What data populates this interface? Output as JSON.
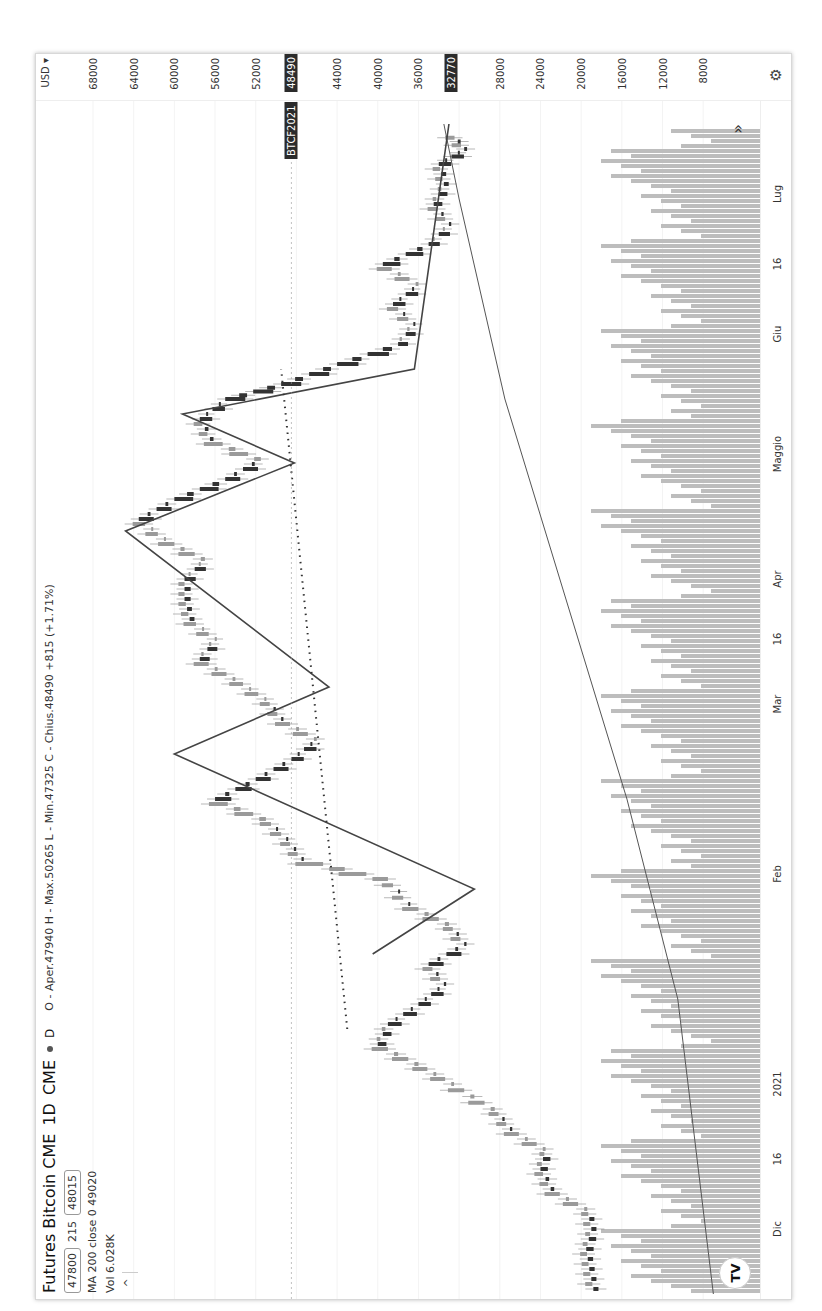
{
  "header": {
    "title": "Futures Bitcoin CME",
    "interval": "1D",
    "exchange": "CME",
    "interval_short": "D",
    "ohlc": "O - Aper.47940 H - Max.50265 L - Min.47325 C - Chius.48490 +815 (+1.71%)"
  },
  "quote": {
    "bid": "47800",
    "spread": "215",
    "ask": "48015"
  },
  "indicators": {
    "ma": "MA 200 close 0  49020",
    "vol": "Vol  6.028K",
    "collapse_icon": "^"
  },
  "price_axis": {
    "currency": "USD ▾",
    "ticks": [
      "68000",
      "64000",
      "60000",
      "56000",
      "52000",
      "44000",
      "40000",
      "36000",
      "28000",
      "24000",
      "20000",
      "16000",
      "12000",
      "8000"
    ],
    "current_symbol": "BTCF2021",
    "current_price": "48490",
    "second_price": "32770"
  },
  "time_axis": {
    "labels": [
      {
        "t": "Dic",
        "u": 70
      },
      {
        "t": "16",
        "u": 140
      },
      {
        "t": "2021",
        "u": 215
      },
      {
        "t": "Feb",
        "u": 425
      },
      {
        "t": "Mar",
        "u": 595
      },
      {
        "t": "16",
        "u": 660
      },
      {
        "t": "Apr",
        "u": 720
      },
      {
        "t": "Maggio",
        "u": 845
      },
      {
        "t": "Giu",
        "u": 965
      },
      {
        "t": "16",
        "u": 1035
      },
      {
        "t": "Lug",
        "u": 1105
      }
    ]
  },
  "colors": {
    "candle_up": "#9a9a9a",
    "candle_down": "#333333",
    "volume": "#bdbdbd",
    "ma": "#555555",
    "zigzag": "#444444",
    "grid": "#e6e6e6"
  },
  "chart_data": {
    "type": "candlestick",
    "title": "Futures Bitcoin CME 1D CME",
    "xlabel": "",
    "ylabel": "USD",
    "ylim": [
      6000,
      70000
    ],
    "x_ticks": [
      "Dic",
      "16",
      "2021",
      "Feb",
      "Mar",
      "16",
      "Apr",
      "Maggio",
      "Giu",
      "16",
      "Lug"
    ],
    "y_ticks": [
      68000,
      64000,
      60000,
      56000,
      52000,
      48000,
      44000,
      40000,
      36000,
      32000,
      28000,
      24000,
      20000,
      16000,
      12000,
      8000
    ],
    "last_close": 48490,
    "marked_price": 32770,
    "closes": [
      {
        "u": 10,
        "p": 18800
      },
      {
        "u": 30,
        "p": 19200
      },
      {
        "u": 50,
        "p": 19500
      },
      {
        "u": 70,
        "p": 19000
      },
      {
        "u": 90,
        "p": 19400
      },
      {
        "u": 110,
        "p": 23000
      },
      {
        "u": 130,
        "p": 24000
      },
      {
        "u": 150,
        "p": 23500
      },
      {
        "u": 170,
        "p": 27000
      },
      {
        "u": 190,
        "p": 28500
      },
      {
        "u": 215,
        "p": 32500
      },
      {
        "u": 235,
        "p": 36000
      },
      {
        "u": 255,
        "p": 40000
      },
      {
        "u": 275,
        "p": 39000
      },
      {
        "u": 295,
        "p": 36000
      },
      {
        "u": 315,
        "p": 33500
      },
      {
        "u": 335,
        "p": 35000
      },
      {
        "u": 355,
        "p": 31500
      },
      {
        "u": 375,
        "p": 33000
      },
      {
        "u": 395,
        "p": 37000
      },
      {
        "u": 420,
        "p": 39000
      },
      {
        "u": 440,
        "p": 47500
      },
      {
        "u": 460,
        "p": 49000
      },
      {
        "u": 480,
        "p": 51000
      },
      {
        "u": 500,
        "p": 56000
      },
      {
        "u": 520,
        "p": 52000
      },
      {
        "u": 540,
        "p": 48500
      },
      {
        "u": 560,
        "p": 46000
      },
      {
        "u": 580,
        "p": 49500
      },
      {
        "u": 600,
        "p": 51000
      },
      {
        "u": 620,
        "p": 54000
      },
      {
        "u": 640,
        "p": 57500
      },
      {
        "u": 660,
        "p": 56000
      },
      {
        "u": 680,
        "p": 58500
      },
      {
        "u": 700,
        "p": 59000
      },
      {
        "u": 720,
        "p": 59000
      },
      {
        "u": 740,
        "p": 57000
      },
      {
        "u": 760,
        "p": 61000
      },
      {
        "u": 780,
        "p": 63500
      },
      {
        "u": 800,
        "p": 60000
      },
      {
        "u": 820,
        "p": 55000
      },
      {
        "u": 840,
        "p": 51500
      },
      {
        "u": 860,
        "p": 56500
      },
      {
        "u": 880,
        "p": 57500
      },
      {
        "u": 900,
        "p": 55000
      },
      {
        "u": 915,
        "p": 49500
      },
      {
        "u": 935,
        "p": 44000
      },
      {
        "u": 955,
        "p": 38000
      },
      {
        "u": 975,
        "p": 36500
      },
      {
        "u": 995,
        "p": 38500
      },
      {
        "u": 1015,
        "p": 36000
      },
      {
        "u": 1035,
        "p": 39500
      },
      {
        "u": 1055,
        "p": 35000
      },
      {
        "u": 1075,
        "p": 33000
      },
      {
        "u": 1095,
        "p": 34500
      },
      {
        "u": 1115,
        "p": 33500
      },
      {
        "u": 1135,
        "p": 34000
      },
      {
        "u": 1150,
        "p": 31500
      },
      {
        "u": 1165,
        "p": 32770
      }
    ],
    "ma200": [
      {
        "u": 5,
        "p": 7000
      },
      {
        "u": 300,
        "p": 10500
      },
      {
        "u": 500,
        "p": 15500
      },
      {
        "u": 700,
        "p": 21500
      },
      {
        "u": 900,
        "p": 27500
      },
      {
        "u": 1100,
        "p": 32000
      },
      {
        "u": 1175,
        "p": 33500
      }
    ],
    "zigzag": [
      {
        "u": 345,
        "p": 40500
      },
      {
        "u": 410,
        "p": 30500
      },
      {
        "u": 545,
        "p": 60000
      },
      {
        "u": 612,
        "p": 44800
      },
      {
        "u": 768,
        "p": 64800
      },
      {
        "u": 836,
        "p": 48200
      },
      {
        "u": 885,
        "p": 59200
      },
      {
        "u": 930,
        "p": 36400
      },
      {
        "u": 1175,
        "p": 33000
      }
    ],
    "trendline_dotted": [
      {
        "u": 270,
        "p": 43000
      },
      {
        "u": 930,
        "p": 49500
      }
    ]
  }
}
